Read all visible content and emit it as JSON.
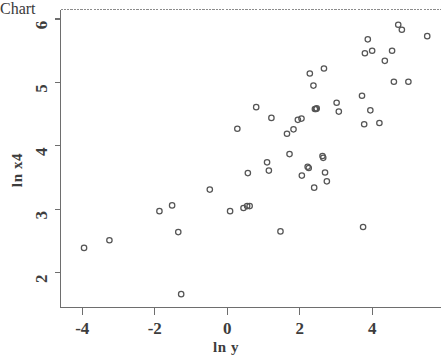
{
  "chart_data": {
    "type": "scatter",
    "title": "",
    "subtitle": "",
    "xlabel": "ln y",
    "ylabel": "ln x4",
    "xlim": [
      -4.6,
      5.9
    ],
    "ylim": [
      1.45,
      6.15
    ],
    "xticks": [
      -4,
      -2,
      0,
      2,
      4
    ],
    "xticklabels": [
      "-4",
      "-2",
      "0",
      "2",
      "4"
    ],
    "yticks": [
      2,
      3,
      4,
      5,
      6
    ],
    "yticklabels": [
      "2",
      "3",
      "4",
      "5",
      "6"
    ],
    "grid": false,
    "legend": null,
    "marker": "open-circle",
    "marker_color": "#555555",
    "n_points": 63,
    "series": [
      {
        "name": "observations",
        "points": [
          [
            -3.95,
            2.39
          ],
          [
            -3.25,
            2.51
          ],
          [
            -1.87,
            2.97
          ],
          [
            -1.52,
            3.06
          ],
          [
            -1.35,
            2.64
          ],
          [
            -1.27,
            1.66
          ],
          [
            -0.48,
            3.31
          ],
          [
            0.08,
            2.97
          ],
          [
            0.28,
            4.27
          ],
          [
            0.45,
            3.02
          ],
          [
            0.55,
            3.05
          ],
          [
            0.62,
            3.05
          ],
          [
            0.57,
            3.57
          ],
          [
            0.8,
            4.61
          ],
          [
            1.1,
            3.74
          ],
          [
            1.15,
            3.61
          ],
          [
            1.22,
            4.44
          ],
          [
            1.47,
            2.65
          ],
          [
            1.65,
            4.19
          ],
          [
            1.72,
            3.87
          ],
          [
            1.83,
            4.26
          ],
          [
            1.95,
            4.41
          ],
          [
            2.05,
            4.43
          ],
          [
            2.06,
            3.53
          ],
          [
            2.22,
            3.67
          ],
          [
            2.25,
            3.65
          ],
          [
            2.28,
            5.14
          ],
          [
            2.38,
            4.95
          ],
          [
            2.4,
            3.34
          ],
          [
            2.42,
            4.58
          ],
          [
            2.45,
            4.58
          ],
          [
            2.47,
            4.59
          ],
          [
            2.63,
            3.84
          ],
          [
            2.65,
            3.81
          ],
          [
            2.67,
            5.22
          ],
          [
            2.7,
            3.58
          ],
          [
            2.75,
            3.44
          ],
          [
            3.02,
            4.68
          ],
          [
            3.08,
            4.54
          ],
          [
            3.72,
            4.79
          ],
          [
            3.75,
            2.72
          ],
          [
            3.78,
            4.34
          ],
          [
            3.8,
            5.46
          ],
          [
            3.88,
            5.68
          ],
          [
            3.95,
            4.56
          ],
          [
            4.0,
            5.5
          ],
          [
            4.2,
            4.36
          ],
          [
            4.35,
            5.34
          ],
          [
            4.55,
            5.5
          ],
          [
            4.6,
            5.01
          ],
          [
            4.72,
            5.91
          ],
          [
            4.82,
            5.83
          ],
          [
            5.0,
            5.01
          ],
          [
            5.52,
            5.73
          ]
        ]
      }
    ]
  },
  "axes": {
    "x_title": "ln y",
    "y_title": "ln x4"
  }
}
